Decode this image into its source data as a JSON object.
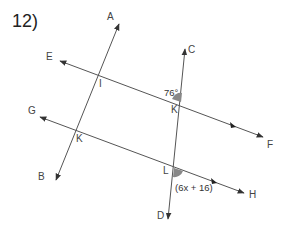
{
  "problem": {
    "number": "12)"
  },
  "diagram": {
    "points": {
      "A": "A",
      "B": "B",
      "C": "C",
      "D": "D",
      "E": "E",
      "F": "F",
      "G": "G",
      "H": "H",
      "I": "I",
      "K1": "K",
      "K2": "K",
      "L": "L"
    },
    "angles": {
      "given": "76°",
      "expression": "(6x + 16)"
    },
    "colors": {
      "line": "#555555",
      "angle_fill": "#888888"
    }
  }
}
